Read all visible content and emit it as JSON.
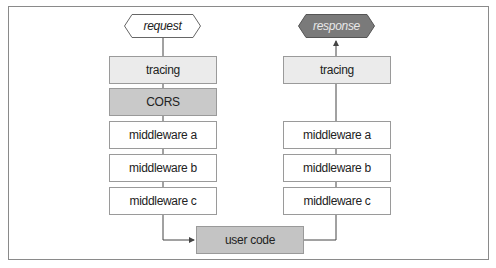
{
  "diagram": {
    "type": "flowchart",
    "colors": {
      "frame_border": "#8a8a8a",
      "box_border": "#9a9a9a",
      "light_fill": "#ebebeb",
      "cors_fill": "#c9c9c9",
      "user_code_fill": "#c4c4c4",
      "response_fill": "#7a7a7a",
      "line": "#444444"
    },
    "request_column": {
      "start": "request",
      "layers": [
        "tracing",
        "CORS",
        "middleware a",
        "middleware b",
        "middleware c"
      ]
    },
    "response_column": {
      "end": "response",
      "layers": [
        "tracing",
        "middleware a",
        "middleware b",
        "middleware c"
      ]
    },
    "center": {
      "label": "user code"
    }
  }
}
